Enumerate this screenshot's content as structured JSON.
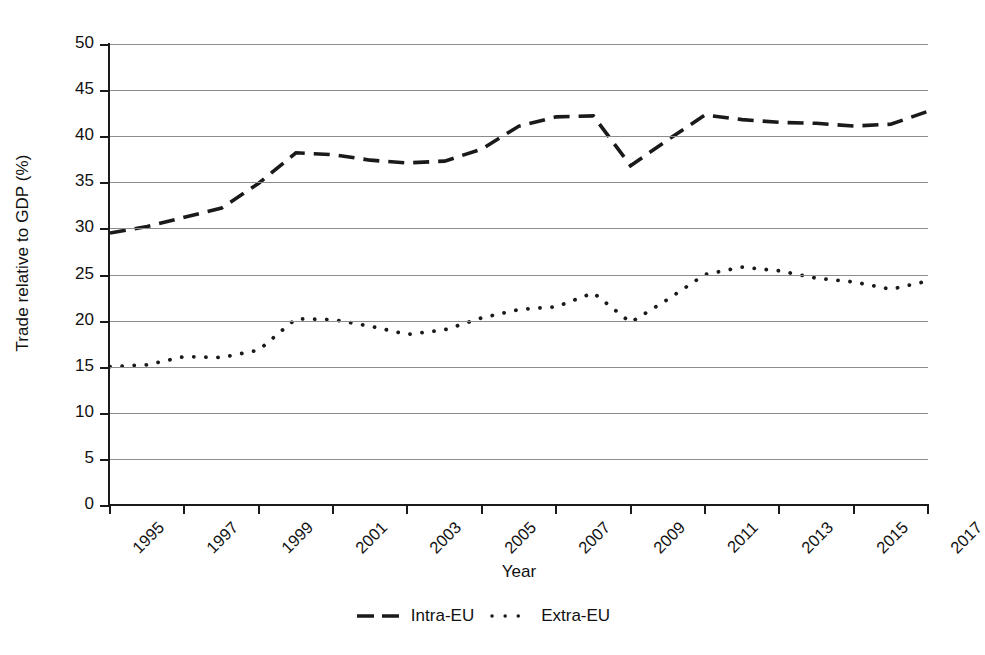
{
  "chart_data": {
    "type": "line",
    "title": "",
    "xlabel": "Year",
    "ylabel": "Trade relative to GDP (%)",
    "xlim": [
      1995,
      2017
    ],
    "ylim": [
      0,
      50
    ],
    "ytick_step": 5,
    "xtick_step": 2,
    "grid": "horizontal",
    "legend_position": "bottom",
    "x": [
      1995,
      1996,
      1997,
      1998,
      1999,
      2000,
      2001,
      2002,
      2003,
      2004,
      2005,
      2006,
      2007,
      2008,
      2009,
      2010,
      2011,
      2012,
      2013,
      2014,
      2015,
      2016,
      2017
    ],
    "yticks": [
      "0",
      "5",
      "10",
      "15",
      "20",
      "25",
      "30",
      "35",
      "40",
      "45",
      "50"
    ],
    "xticks": [
      "1995",
      "1997",
      "1999",
      "2001",
      "2003",
      "2005",
      "2007",
      "2009",
      "2011",
      "2013",
      "2015",
      "2017"
    ],
    "series": [
      {
        "name": "Intra-EU",
        "style": "dashed",
        "color": "#1a1a1a",
        "values": [
          29.5,
          30.2,
          31.2,
          32.2,
          34.9,
          38.2,
          38.0,
          37.4,
          37.1,
          37.3,
          38.6,
          41.1,
          42.1,
          42.2,
          36.8,
          39.6,
          42.3,
          41.8,
          41.5,
          41.4,
          41.1,
          41.3,
          42.7
        ]
      },
      {
        "name": "Extra-EU",
        "style": "dotted",
        "color": "#1a1a1a",
        "values": [
          15.0,
          15.2,
          16.1,
          16.0,
          16.8,
          20.2,
          20.1,
          19.4,
          18.5,
          19.0,
          20.3,
          21.2,
          21.5,
          23.0,
          19.8,
          22.3,
          25.0,
          25.8,
          25.4,
          24.6,
          24.2,
          23.4,
          24.3
        ]
      }
    ]
  },
  "legend": {
    "items": [
      {
        "label": "Intra-EU",
        "marker": "dashed-line-marker"
      },
      {
        "label": "Extra-EU",
        "marker": "dotted-line-marker"
      }
    ]
  }
}
